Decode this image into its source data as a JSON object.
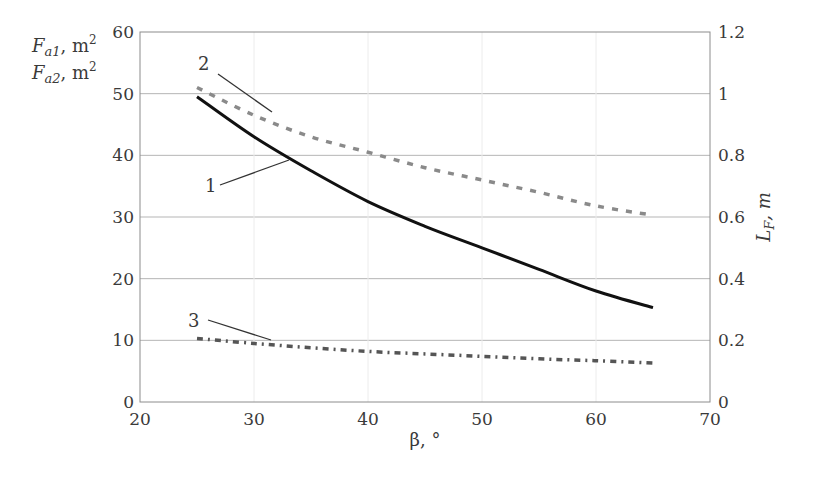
{
  "chart_data": {
    "type": "line",
    "title": "",
    "xlabel": "β, °",
    "ylabel_left_lines": [
      {
        "main": "F",
        "sub": "a1",
        "unit": ", m",
        "sup": "2"
      },
      {
        "main": "F",
        "sub": "a2",
        "unit": ", m",
        "sup": "2"
      }
    ],
    "ylabel_right": {
      "main": "L",
      "sub": "F",
      "unit": ", m"
    },
    "xlim": [
      20,
      70
    ],
    "ylim_left": [
      0,
      60
    ],
    "ylim_right": [
      0,
      1.2
    ],
    "x_ticks": [
      "20",
      "30",
      "40",
      "50",
      "60",
      "70"
    ],
    "y_ticks_left": [
      "0",
      "10",
      "20",
      "30",
      "40",
      "50",
      "60"
    ],
    "y_ticks_right": [
      "0",
      "0.2",
      "0.4",
      "0.6",
      "0.8",
      "1",
      "1.2"
    ],
    "grid": true,
    "x": [
      25,
      30,
      35,
      40,
      45,
      50,
      55,
      60,
      65
    ],
    "series": [
      {
        "name": "1",
        "style": "solid",
        "color": "#111111",
        "values": [
          49.5,
          43.0,
          37.5,
          32.5,
          28.5,
          25.0,
          21.5,
          18.0,
          15.3
        ]
      },
      {
        "name": "2",
        "style": "dashed",
        "color": "#8a8a8a",
        "values": [
          51.0,
          46.5,
          43.0,
          40.5,
          38.0,
          36.0,
          34.0,
          31.8,
          30.3
        ]
      },
      {
        "name": "3",
        "style": "dash-dot",
        "color": "#555555",
        "values": [
          10.3,
          9.5,
          8.8,
          8.2,
          7.8,
          7.4,
          7.0,
          6.7,
          6.3
        ]
      }
    ],
    "annotations": [
      {
        "text": "1",
        "label_pos": [
          205,
          192
        ],
        "line": [
          [
            220,
            185
          ],
          [
            289,
            160
          ]
        ]
      },
      {
        "text": "2",
        "label_pos": [
          198,
          70
        ],
        "line": [
          [
            218,
            74
          ],
          [
            272,
            112
          ]
        ]
      },
      {
        "text": "3",
        "label_pos": [
          188,
          327
        ],
        "line": [
          [
            208,
            320
          ],
          [
            271,
            340
          ]
        ]
      }
    ]
  }
}
